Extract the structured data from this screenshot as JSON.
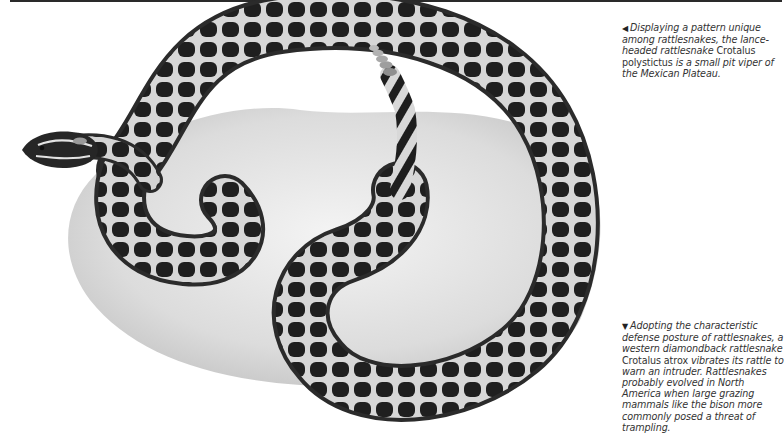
{
  "captions": {
    "top": {
      "arrow": "◀",
      "text_before": "Displaying a pattern unique among rattlesnakes, the lance-headed rattlesnake ",
      "species": "Crotalus polystictus",
      "text_after": " is a small pit viper of the Mexican Plateau."
    },
    "bottom": {
      "arrow": "▼",
      "text_before": "Adopting the characteristic defense posture of rattlesnakes, a western diamondback rattlesnake ",
      "species": "Crotalus atrox",
      "text_after": " vibrates its rattle to warn an intruder. Rattlesnakes probably evolved in North America when large grazing mammals like the bison more commonly posed a threat of trampling."
    }
  },
  "illustration": {
    "subject": "lance-headed rattlesnake coiled on rock",
    "colors": {
      "blotch": "#1c1c1c",
      "body": "#3a3a3a",
      "pattern_lines": "#e8e8e8",
      "rock": "#e4e4e4",
      "rock_shadow": "#c9c9c9"
    }
  }
}
